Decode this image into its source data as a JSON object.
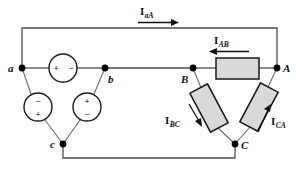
{
  "figure": {
    "type": "circuit-diagram",
    "colors": {
      "wire": "#4d4d4d",
      "lead": "#6b6b6b",
      "component_outline": "#1a1a1a",
      "resistor_fill": "#d9d9d9",
      "node_dot": "#000000",
      "text": "#111111",
      "background": "#ffffff"
    }
  },
  "nodes": [
    {
      "id": "a",
      "label": "a",
      "x": 22,
      "y": 68,
      "label_x": 8,
      "label_y": 72
    },
    {
      "id": "b",
      "label": "b",
      "x": 105,
      "y": 68,
      "label_x": 108,
      "label_y": 82
    },
    {
      "id": "c",
      "label": "c",
      "x": 63,
      "y": 144,
      "label_x": 50,
      "label_y": 148
    },
    {
      "id": "A",
      "label": "A",
      "x": 277,
      "y": 68,
      "label_x": 283,
      "label_y": 72
    },
    {
      "id": "B",
      "label": "B",
      "x": 193,
      "y": 68,
      "label_x": 183,
      "label_y": 82
    },
    {
      "id": "C",
      "label": "C",
      "x": 235,
      "y": 144,
      "label_x": 241,
      "label_y": 148
    }
  ],
  "sources": [
    {
      "id": "source-ab",
      "name": "source-ab",
      "cx": 63,
      "cy": 68,
      "r": 14,
      "signs": [
        {
          "text": "+",
          "x": 56,
          "y": 68
        },
        {
          "text": "−",
          "x": 71,
          "y": 68
        }
      ]
    },
    {
      "id": "source-ca",
      "name": "source-ca",
      "cx": 38,
      "cy": 107,
      "r": 14,
      "signs": [
        {
          "text": "−",
          "x": 38,
          "y": 101
        },
        {
          "text": "+",
          "x": 38,
          "y": 114
        }
      ]
    },
    {
      "id": "source-bc",
      "name": "source-bc",
      "cx": 87,
      "cy": 107,
      "r": 14,
      "signs": [
        {
          "text": "+",
          "x": 87,
          "y": 101
        },
        {
          "text": "−",
          "x": 87,
          "y": 114
        }
      ]
    }
  ],
  "loads": [
    {
      "id": "load-AB",
      "name": "load-resistor-ab",
      "shape": "rect",
      "x": 216,
      "y": 58,
      "w": 43,
      "h": 21,
      "rotation": 0
    },
    {
      "id": "load-BC",
      "name": "load-resistor-bc",
      "shape": "rect",
      "cx": 209,
      "cy": 108,
      "w": 20,
      "h": 44,
      "rotation": 33
    },
    {
      "id": "load-CA",
      "name": "load-resistor-ca",
      "shape": "rect",
      "cx": 259,
      "cy": 107,
      "w": 20,
      "h": 44,
      "rotation": -27
    }
  ],
  "currents": [
    {
      "id": "I_aA",
      "symbol": "I",
      "subscript": "aA",
      "label_x": 140,
      "label_y": 14,
      "arrow": {
        "x1": 138,
        "y1": 22,
        "x2": 178,
        "y2": 22,
        "direction": "right"
      }
    },
    {
      "id": "I_AB",
      "symbol": "I",
      "subscript": "AB",
      "label_x": 215,
      "label_y": 43,
      "arrow": {
        "x1": 248,
        "y1": 51,
        "x2": 210,
        "y2": 51,
        "direction": "left"
      }
    },
    {
      "id": "I_BC",
      "symbol": "I",
      "subscript": "BC",
      "label_x": 167,
      "label_y": 123,
      "arrow": {
        "x1": 189,
        "y1": 105,
        "x2": 202,
        "y2": 126,
        "direction": "down-right"
      }
    },
    {
      "id": "I_CA",
      "symbol": "I",
      "subscript": "CA",
      "label_x": 272,
      "label_y": 124,
      "arrow": {
        "x1": 258,
        "y1": 131,
        "x2": 270,
        "y2": 105,
        "direction": "up-right"
      }
    }
  ],
  "wires": {
    "top_line": "M22,68 L22,28 L277,28 L277,68",
    "bottom_line": "M63,144 L63,158 L235,158 L235,144",
    "a_to_b": "M22,68 L105,68",
    "B_to_A": "M193,68 L277,68"
  }
}
